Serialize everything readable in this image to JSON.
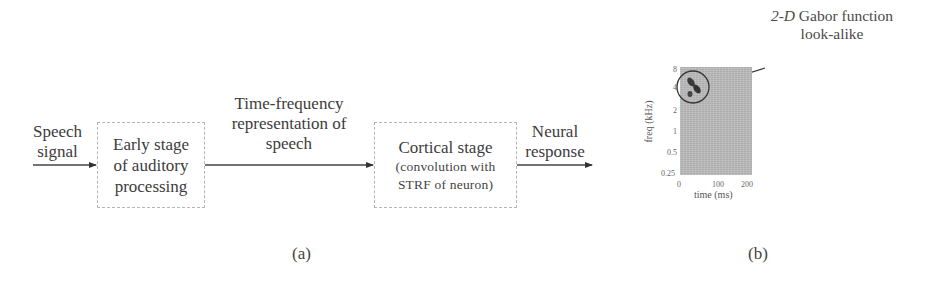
{
  "figure": {
    "panel_a": {
      "input_label": [
        "Speech",
        "signal"
      ],
      "block1": {
        "lines": [
          "Early stage",
          "of auditory",
          "processing"
        ]
      },
      "mid_label": [
        "Time-frequency",
        "representation of",
        "speech"
      ],
      "block2": {
        "title": "Cortical stage",
        "sub": [
          "(convolution with",
          "STRF of neuron)"
        ]
      },
      "output_label": [
        "Neural",
        "response"
      ],
      "caption": "(a)"
    },
    "panel_b": {
      "annotation": {
        "italic": "2-D",
        "rest": " Gabor function",
        "line2": "look-alike"
      },
      "xlabel": "time (ms)",
      "ylabel": "freq (kHz)",
      "xticks": [
        "0",
        "100",
        "200"
      ],
      "yticks": [
        "8",
        "4",
        "2",
        "1",
        "0.5",
        "0.25"
      ],
      "caption": "(b)"
    }
  },
  "colors": {
    "line": "#333333",
    "box_border": "#b5b5b5",
    "plot_bg": "#bdbdbd"
  }
}
